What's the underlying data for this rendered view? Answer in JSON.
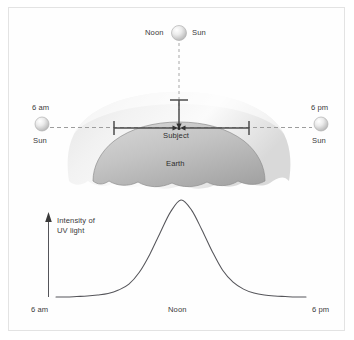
{
  "figure": {
    "background_color": "#ffffff",
    "frame_color": "#e3e3e3"
  },
  "upper_diagram": {
    "name": "sun-path-over-earth",
    "sun_noon": {
      "label_time": "Noon",
      "label_body": "Sun",
      "x": 179,
      "y": 33,
      "radius": 7.5
    },
    "sun_morning": {
      "label_time": "6 am",
      "label_body": "Sun",
      "x": 42,
      "y": 124,
      "radius": 7
    },
    "sun_evening": {
      "label_time": "6 pm",
      "label_body": "Sun",
      "x": 321,
      "y": 124,
      "radius": 7
    },
    "subject_label": "Subject",
    "earth_label": "Earth",
    "subject_point": {
      "x": 179,
      "y": 128
    },
    "atmosphere_color_top": "#fdfdfd",
    "atmosphere_color_bottom": "#d2d2d2",
    "earth_color_top": "#c9c9c9",
    "earth_color_bottom": "#a8a8a8",
    "ray_line_color": "#4a4a4a",
    "dashed_line_color": "#9a9a9a"
  },
  "chart_data": {
    "type": "line",
    "title": "",
    "xlabel": "",
    "ylabel": "Intensity of UV light",
    "ylabel_line1": "Intensity of",
    "ylabel_line2": "UV light",
    "tick_labels": [
      "6 am",
      "Noon",
      "6 pm"
    ],
    "legend": [],
    "grid": false,
    "xlim": [
      0,
      12
    ],
    "ylim": [
      0,
      1
    ],
    "axis_style": "arrow-up-y-axis-only",
    "curve_color": "#55555a",
    "x": [
      0,
      0.5,
      1,
      1.5,
      2,
      2.5,
      3,
      3.5,
      4,
      4.5,
      5,
      5.5,
      6,
      6.5,
      7,
      7.5,
      8,
      8.5,
      9,
      9.5,
      10,
      10.5,
      11,
      11.5,
      12
    ],
    "series": [
      {
        "name": "UV intensity",
        "values": [
          0.02,
          0.02,
          0.025,
          0.03,
          0.04,
          0.055,
          0.09,
          0.15,
          0.27,
          0.45,
          0.67,
          0.88,
          1.0,
          0.9,
          0.7,
          0.48,
          0.29,
          0.17,
          0.1,
          0.06,
          0.04,
          0.03,
          0.025,
          0.02,
          0.02
        ]
      }
    ],
    "annotations": [
      {
        "text": "6 am",
        "x": 0,
        "position": "below-axis-left"
      },
      {
        "text": "Noon",
        "x": 6,
        "position": "below-axis-center"
      },
      {
        "text": "6 pm",
        "x": 12,
        "position": "below-axis-right"
      }
    ]
  }
}
